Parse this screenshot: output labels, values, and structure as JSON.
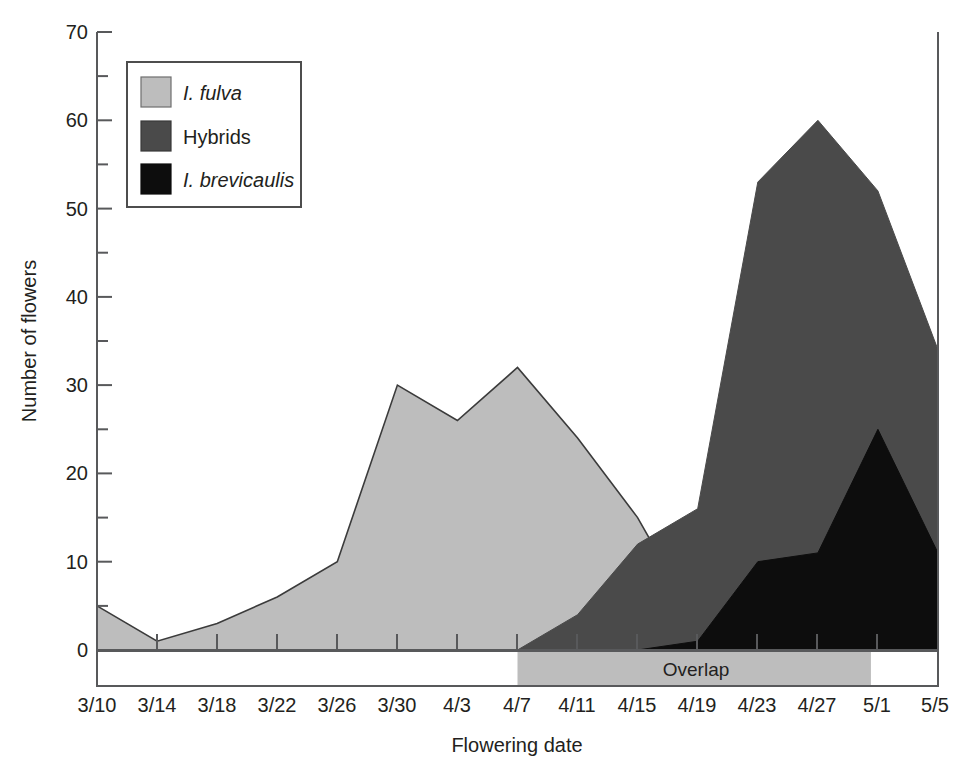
{
  "chart_data": {
    "type": "area",
    "title": "",
    "subtitle": "",
    "xlabel": "Flowering date",
    "ylabel": "Number of flowers",
    "categories": [
      "3/10",
      "3/14",
      "3/18",
      "3/22",
      "3/26",
      "3/30",
      "4/3",
      "4/7",
      "4/11",
      "4/15",
      "4/19",
      "4/23",
      "4/27",
      "5/1",
      "5/5"
    ],
    "x_tick_labels": [
      "3/10",
      "3/14",
      "3/18",
      "3/22",
      "3/26",
      "3/30",
      "4/3",
      "4/7",
      "4/11",
      "4/15",
      "4/19",
      "4/23",
      "4/27",
      "5/1",
      "5/5"
    ],
    "y_tick_labels": [
      "0",
      "10",
      "20",
      "30",
      "40",
      "50",
      "60",
      "70"
    ],
    "y_major_ticks": [
      0,
      10,
      20,
      30,
      40,
      50,
      60,
      70
    ],
    "y_minor_ticks": [
      5,
      15,
      25,
      35,
      45,
      55,
      65
    ],
    "ylim": [
      0,
      70
    ],
    "grid": false,
    "legend_position": "top-left",
    "stacked": false,
    "series": [
      {
        "name": "I. fulva",
        "italic": true,
        "color": "#bdbdbd",
        "values": [
          5,
          1,
          3,
          6,
          10,
          30,
          26,
          32,
          24,
          15,
          3,
          0,
          0,
          0,
          0
        ]
      },
      {
        "name": "Hybrids",
        "italic": false,
        "color": "#4a4a4a",
        "values": [
          0,
          0,
          0,
          0,
          0,
          0,
          0,
          0,
          4,
          12,
          16,
          53,
          60,
          52,
          34
        ]
      },
      {
        "name": "I. brevicaulis",
        "italic": true,
        "color": "#0d0d0d",
        "values": [
          0,
          0,
          0,
          0,
          0,
          0,
          0,
          0,
          0,
          0,
          1,
          10,
          11,
          25,
          11
        ]
      }
    ],
    "annotations": [
      {
        "name": "overlap-band",
        "label": "Overlap",
        "x_start": "4/7",
        "x_end": "5/1",
        "color": "#bdbdbd"
      }
    ]
  },
  "legend": {
    "items": [
      {
        "label": "I. fulva",
        "swatch": "#bdbdbd",
        "italic": true
      },
      {
        "label": "Hybrids",
        "swatch": "#4a4a4a",
        "italic": false
      },
      {
        "label": "I. brevicaulis",
        "swatch": "#0d0d0d",
        "italic": true
      }
    ]
  },
  "axes": {
    "y_title": "Number of flowers",
    "x_title": "Flowering date"
  }
}
